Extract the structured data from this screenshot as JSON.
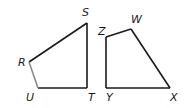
{
  "figure": {
    "shapes": [
      {
        "name": "RSTU",
        "vertices": [
          {
            "label": "R",
            "x": 29,
            "y": 62,
            "lx": 18,
            "ly": 66
          },
          {
            "label": "S",
            "x": 87,
            "y": 23,
            "lx": 82,
            "ly": 16
          },
          {
            "label": "T",
            "x": 87,
            "y": 88,
            "lx": 89,
            "ly": 101
          },
          {
            "label": "U",
            "x": 38,
            "y": 88,
            "lx": 26,
            "ly": 101
          }
        ]
      },
      {
        "name": "ZWXY",
        "vertices": [
          {
            "label": "Z",
            "x": 106,
            "y": 37,
            "lx": 98,
            "ly": 35
          },
          {
            "label": "W",
            "x": 131,
            "y": 29,
            "lx": 131,
            "ly": 23
          },
          {
            "label": "X",
            "x": 170,
            "y": 88,
            "lx": 171,
            "ly": 101
          },
          {
            "label": "Y",
            "x": 106,
            "y": 88,
            "lx": 106,
            "ly": 101
          }
        ]
      }
    ]
  },
  "labels": {
    "R": "R",
    "S": "S",
    "T": "T",
    "U": "U",
    "Z": "Z",
    "W": "W",
    "X": "X",
    "Y": "Y"
  }
}
